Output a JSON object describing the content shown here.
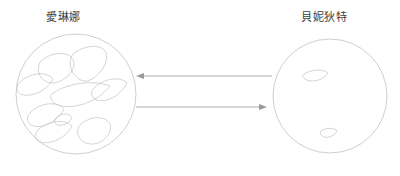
{
  "diagram": {
    "type": "two-cell-comparison-diagram",
    "background_color": "#ffffff",
    "outline_color": "#b9b9bd",
    "organelle_color": "#c2c2c6",
    "arrow_color": "#9a9a9e",
    "left_cell": {
      "label": "愛琳娜",
      "center_x": 76,
      "center_y": 94,
      "radius": 60,
      "organelle_count": 9
    },
    "right_cell": {
      "label": "貝妮狄特",
      "center_x": 330,
      "center_y": 96,
      "radius": 57,
      "organelle_count": 2
    },
    "arrows": [
      {
        "name": "arrow-right-to-left",
        "direction": "left",
        "from_x": 272,
        "to_x": 137,
        "y": 76
      },
      {
        "name": "arrow-left-to-right",
        "direction": "right",
        "from_x": 136,
        "to_x": 266,
        "y": 107
      }
    ]
  }
}
